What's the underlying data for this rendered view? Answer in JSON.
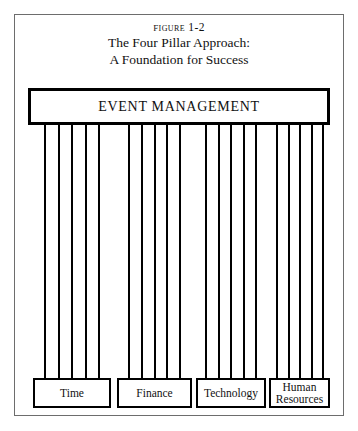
{
  "figure": {
    "caption": {
      "figure_number": "Figure 1-2",
      "title_line_1": "The Four Pillar Approach:",
      "title_line_2": "A Foundation for Success"
    },
    "header_box": {
      "label": "EVENT MANAGEMENT"
    },
    "pillars": {
      "groups_count": 4,
      "pillars_per_group": 5
    },
    "base_boxes": [
      {
        "label": "Time"
      },
      {
        "label": "Finance"
      },
      {
        "label": "Technology"
      },
      {
        "label": "Human\nResources"
      }
    ],
    "colors": {
      "ink": "#000000",
      "frame": "#6d6d6d",
      "page": "#ffffff"
    }
  }
}
